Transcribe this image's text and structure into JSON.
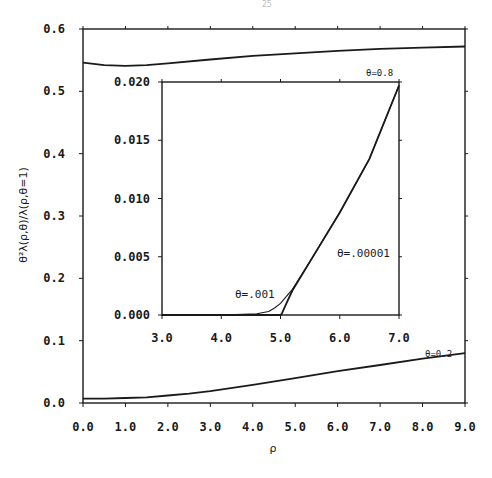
{
  "page": {
    "number_fragment": "25"
  },
  "chart_data": [
    {
      "id": "main",
      "type": "line",
      "title": "",
      "xlabel": "ρ",
      "ylabel": "θ²λ(ρ,θ)/λ(ρ,θ=1)",
      "xlim": [
        0.0,
        9.0
      ],
      "ylim": [
        0.0,
        0.6
      ],
      "x_ticks": [
        "0.0",
        "1.0",
        "2.0",
        "3.0",
        "4.0",
        "5.0",
        "6.0",
        "7.0",
        "8.0",
        "9.0"
      ],
      "y_ticks": [
        "0.0",
        "0.1",
        "0.2",
        "0.3",
        "0.4",
        "0.5",
        "0.6"
      ],
      "grid": false,
      "series": [
        {
          "name": "θ=0.8",
          "label": "θ=0.8",
          "x": [
            0,
            0.5,
            1,
            1.5,
            2,
            3,
            4,
            5,
            6,
            7,
            8,
            9
          ],
          "y": [
            0.546,
            0.542,
            0.541,
            0.542,
            0.545,
            0.551,
            0.557,
            0.561,
            0.565,
            0.568,
            0.57,
            0.572
          ]
        },
        {
          "name": "θ=0.2",
          "label": "θ=0.2",
          "x": [
            0,
            0.5,
            1,
            1.5,
            2,
            2.5,
            3,
            4,
            5,
            6,
            7,
            8,
            9
          ],
          "y": [
            0.007,
            0.007,
            0.008,
            0.009,
            0.012,
            0.015,
            0.019,
            0.029,
            0.04,
            0.051,
            0.061,
            0.071,
            0.08
          ]
        }
      ]
    },
    {
      "id": "inset",
      "type": "line",
      "title": "",
      "xlabel": "",
      "ylabel": "",
      "xlim": [
        3.0,
        7.0
      ],
      "ylim": [
        0.0,
        0.02
      ],
      "x_ticks": [
        "3.0",
        "4.0",
        "5.0",
        "6.0",
        "7.0"
      ],
      "y_ticks": [
        "0.000",
        "0.005",
        "0.010",
        "0.015",
        "0.020"
      ],
      "grid": false,
      "series": [
        {
          "name": "θ=.001",
          "label": "θ=.001",
          "x": [
            3.0,
            4.0,
            4.6,
            4.8,
            4.9,
            5.0,
            5.1,
            5.2,
            5.5,
            6.0,
            6.5,
            7.0
          ],
          "y": [
            0.0,
            0.0,
            0.0001,
            0.0003,
            0.0006,
            0.001,
            0.0016,
            0.0022,
            0.0046,
            0.0088,
            0.0134,
            0.0197
          ]
        },
        {
          "name": "θ=.00001",
          "label": "θ=.00001",
          "x": [
            3.0,
            4.0,
            5.0,
            5.02,
            5.1,
            5.2,
            5.5,
            6.0,
            6.5,
            7.0
          ],
          "y": [
            0.0,
            0.0,
            0.0,
            0.0001,
            0.001,
            0.0021,
            0.0046,
            0.0088,
            0.0134,
            0.0197
          ]
        }
      ]
    }
  ],
  "annotations": {
    "theta_08": "θ=0.8",
    "theta_02": "θ=0.2",
    "theta_001": "θ=.001",
    "theta_00001": "θ=.00001"
  },
  "colors": {
    "line": "#1a1a1a",
    "background": "#ffffff"
  }
}
